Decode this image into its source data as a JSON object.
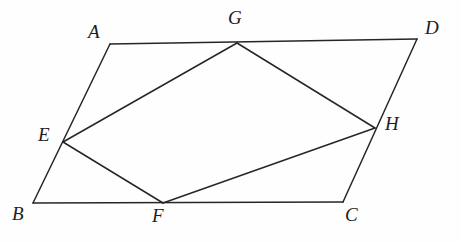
{
  "figure": {
    "type": "geometry-diagram",
    "width": 461,
    "height": 243,
    "background_color": "#fefefe",
    "stroke_color": "#262626",
    "stroke_width": 1.5,
    "points": {
      "A": {
        "label": "A",
        "x": 110,
        "y": 44,
        "label_x": 88,
        "label_y": 22
      },
      "B": {
        "label": "B",
        "x": 33,
        "y": 203,
        "label_x": 12,
        "label_y": 204
      },
      "C": {
        "label": "C",
        "x": 343,
        "y": 202,
        "label_x": 345,
        "label_y": 205
      },
      "D": {
        "label": "D",
        "x": 417,
        "y": 39,
        "label_x": 425,
        "label_y": 18
      },
      "E": {
        "label": "E",
        "x": 63,
        "y": 142,
        "label_x": 38,
        "label_y": 125
      },
      "F": {
        "label": "F",
        "x": 163,
        "y": 203,
        "label_x": 152,
        "label_y": 206
      },
      "G": {
        "label": "G",
        "x": 237,
        "y": 43,
        "label_x": 228,
        "label_y": 8
      },
      "H": {
        "label": "H",
        "x": 375,
        "y": 128,
        "label_x": 385,
        "label_y": 114
      }
    },
    "segments": [
      {
        "name": "side-AD",
        "from": "A",
        "to": "D"
      },
      {
        "name": "side-AB",
        "from": "A",
        "to": "B"
      },
      {
        "name": "side-BC",
        "from": "B",
        "to": "C"
      },
      {
        "name": "side-DC",
        "from": "D",
        "to": "C"
      },
      {
        "name": "chord-EG",
        "from": "E",
        "to": "G"
      },
      {
        "name": "chord-GH",
        "from": "G",
        "to": "H"
      },
      {
        "name": "chord-HF",
        "from": "H",
        "to": "F"
      },
      {
        "name": "chord-FE",
        "from": "F",
        "to": "E"
      }
    ]
  }
}
